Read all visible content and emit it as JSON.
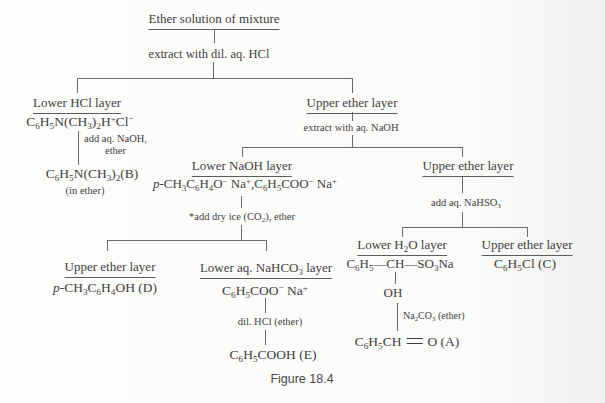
{
  "figure_caption": "Figure 18.4",
  "flow": {
    "root": {
      "label": "Ether solution of mixture"
    },
    "extract_hcl": {
      "label": "extract with dil. aq. HCl"
    },
    "lower_hcl": {
      "header": "Lower HCl layer",
      "formula": "C_6_H_5_N(CH_3_)_2_H^+^Cl^−^",
      "reagent_line1": "add aq. NaOH,",
      "reagent_line2": "ether",
      "product": "C_6_H_5_N(CH_3_)_2_(B)",
      "note": "(in ether)"
    },
    "upper_ether_1": {
      "header": "Upper ether layer",
      "reagent": "extract with aq. NaOH"
    },
    "lower_naoh": {
      "header": "Lower NaOH layer",
      "formula": "`p`-CH_3_C_6_H_4_O^−^ Na^+^,C_6_H_5_COO^−^ Na^+^",
      "reagent": "*add dry ice (CO_2_), ether"
    },
    "upper_ether_2": {
      "header": "Upper ether layer",
      "reagent": "add aq. NaHSO_3_"
    },
    "upper_ether_d": {
      "header": "Upper ether layer",
      "product": "`p`-CH_3_C_6_H_4_OH (D)"
    },
    "lower_nahco3": {
      "header": "Lower aq. NaHCO_3_ layer",
      "formula": "C_6_H_5_COO^−^ Na^+^",
      "reagent": "dil. HCl (ether)",
      "product": "C_6_H_5_COOH (E)"
    },
    "lower_h2o": {
      "header": "Lower H_2_O layer",
      "formula": "C_6_H_5_—CH—SO_3_Na",
      "intermediate": "OH",
      "reagent": "Na_2_CO_3_ (ether)",
      "product": "C_6_H_5_CH~O (A)"
    },
    "upper_ether_c": {
      "header": "Upper ether layer",
      "product": "C_6_H_5_Cl (C)"
    }
  }
}
